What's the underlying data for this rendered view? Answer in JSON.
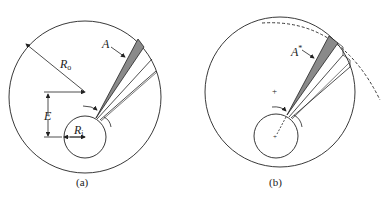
{
  "figure": {
    "panel_a": {
      "caption": "(a)",
      "labels": {
        "outer_radius": "R",
        "outer_radius_sub": "o",
        "inner_radius": "R",
        "inner_radius_sub": "i",
        "eccentricity": "E",
        "area": "A"
      }
    },
    "panel_b": {
      "caption": "(b)",
      "labels": {
        "area": "A",
        "area_sup": "*"
      }
    },
    "colors": {
      "line": "#222222",
      "shaded_wedge": "#8a8a8a"
    }
  }
}
